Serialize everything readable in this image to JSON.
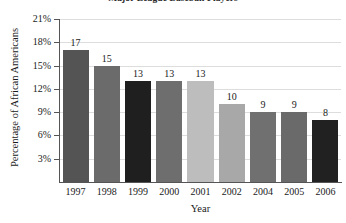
{
  "chart_data": {
    "type": "bar",
    "title": "Major League Baseball Players",
    "xlabel": "Year",
    "ylabel": "Percentage of African Americans",
    "categories": [
      "1997",
      "1998",
      "1999",
      "2000",
      "2001",
      "2002",
      "2004",
      "2005",
      "2006"
    ],
    "values": [
      17,
      15,
      13,
      13,
      13,
      10,
      9,
      9,
      8
    ],
    "value_labels": [
      "17",
      "15",
      "13",
      "13",
      "13",
      "10",
      "9",
      "9",
      "8"
    ],
    "bar_colors": [
      "#545454",
      "#6b6b6b",
      "#1f1f1f",
      "#6e6e6e",
      "#bdbdbd",
      "#a8a8a8",
      "#707070",
      "#6a6a6a",
      "#212121"
    ],
    "ylim": [
      0,
      21
    ],
    "yticks": [
      3,
      6,
      9,
      12,
      15,
      18,
      21
    ],
    "ytick_labels": [
      "3%",
      "6%",
      "9%",
      "12%",
      "15%",
      "18%",
      "21%"
    ],
    "grid": true,
    "grid_color": "#dddddd",
    "legend": "none",
    "axis_color": "#555555",
    "units": "percent"
  }
}
